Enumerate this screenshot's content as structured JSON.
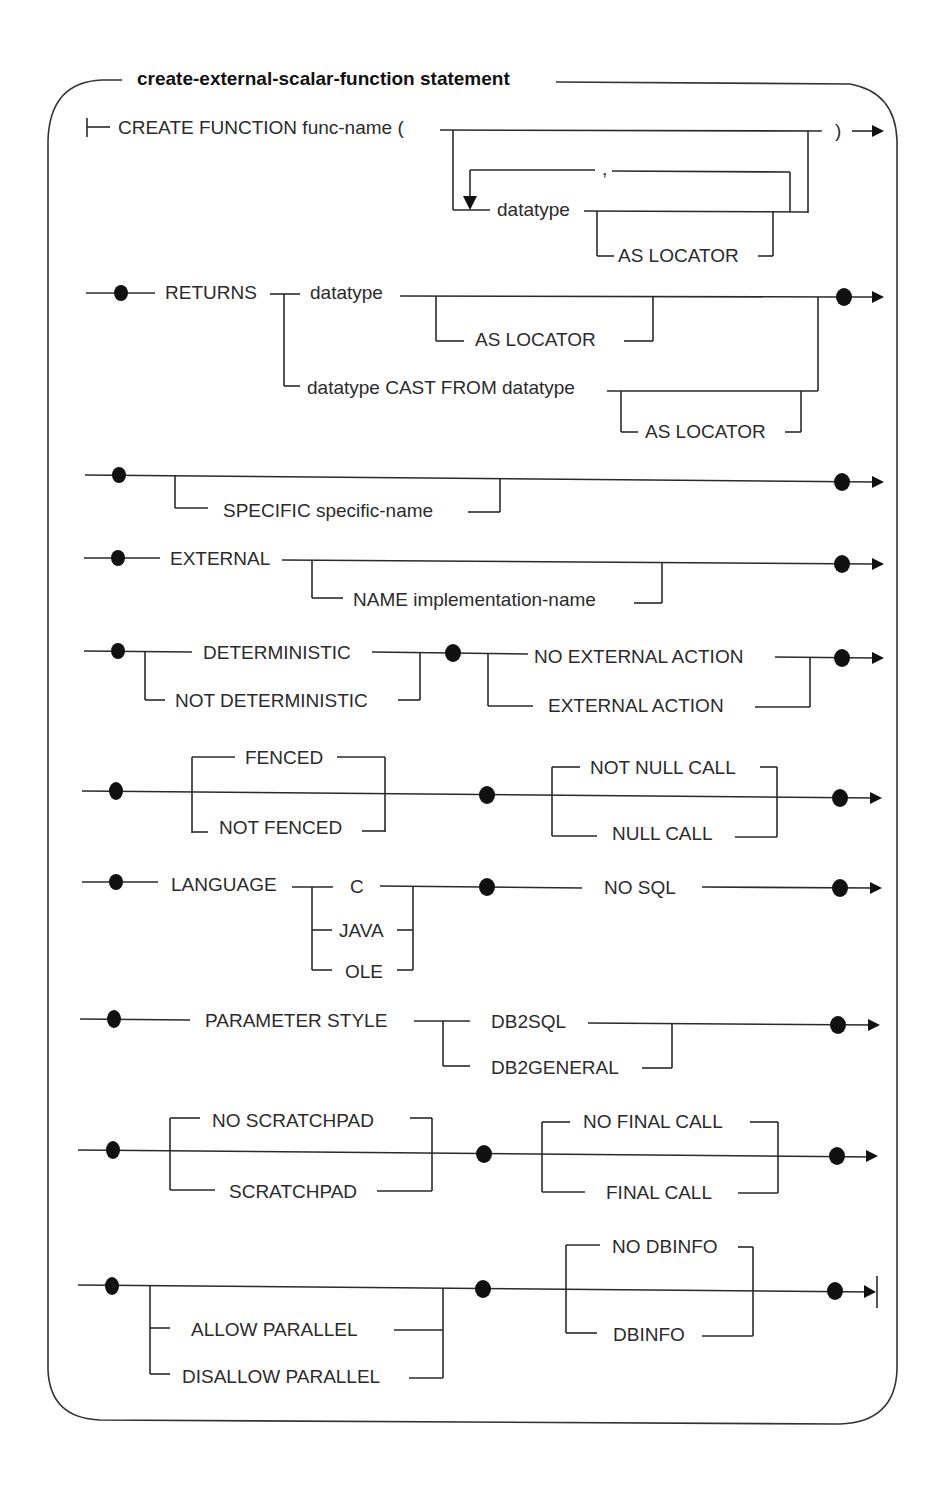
{
  "diagram": {
    "title": "create-external-scalar-function statement",
    "type": "syntax-railroad-diagram",
    "rows": [
      {
        "id": "create",
        "keyword": "CREATE FUNCTION func-name  (",
        "close": ")",
        "loop_separator": ",",
        "param": "datatype",
        "param_opt": "AS LOCATOR"
      },
      {
        "id": "returns",
        "keyword": "RETURNS",
        "opt1": "datatype",
        "opt1_sub": "AS  LOCATOR",
        "opt2": "datatype CAST FROM datatype",
        "opt2_sub": "AS LOCATOR"
      },
      {
        "id": "specific",
        "opt": "SPECIFIC  specific-name"
      },
      {
        "id": "external",
        "keyword": "EXTERNAL",
        "opt": "NAME  implementation-name"
      },
      {
        "id": "deterministic",
        "a1": "DETERMINISTIC",
        "a2": "NOT DETERMINISTIC",
        "b1": "NO EXTERNAL ACTION",
        "b2": "EXTERNAL ACTION"
      },
      {
        "id": "fenced",
        "a1": "FENCED",
        "a2": "NOT FENCED",
        "b1": "NOT NULL CALL",
        "b2": "NULL CALL"
      },
      {
        "id": "language",
        "keyword": "LANGUAGE",
        "opts": [
          "C",
          "JAVA",
          "OLE"
        ],
        "sql": "NO  SQL"
      },
      {
        "id": "param_style",
        "keyword": "PARAMETER  STYLE",
        "opts": [
          "DB2SQL",
          "DB2GENERAL"
        ]
      },
      {
        "id": "scratchpad",
        "a1": "NO  SCRATCHPAD",
        "a2": "SCRATCHPAD",
        "b1": "NO FINAL CALL",
        "b2": "FINAL  CALL"
      },
      {
        "id": "parallel",
        "a1": "ALLOW  PARALLEL",
        "a2": "DISALLOW  PARALLEL",
        "b1": "NO DBINFO",
        "b2": "DBINFO"
      }
    ]
  }
}
